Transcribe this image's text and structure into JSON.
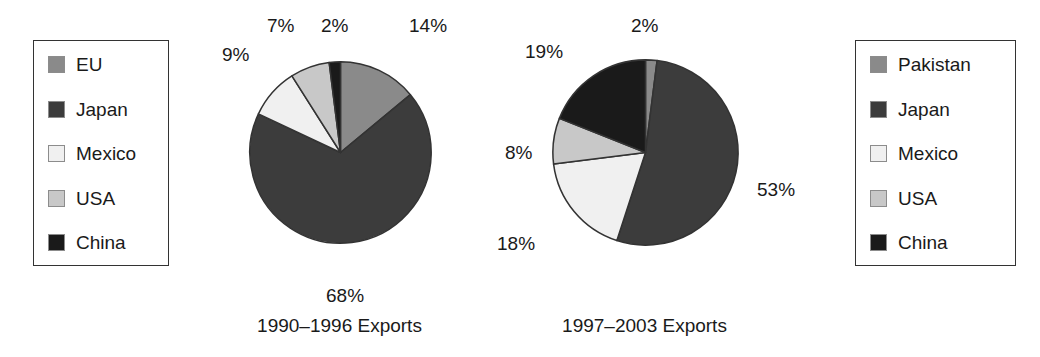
{
  "figure": {
    "background": "#ffffff",
    "width": 1040,
    "height": 357
  },
  "palette": {
    "medium_gray": "#8a8a8a",
    "dark_gray": "#3c3c3c",
    "near_white": "#f0f0f0",
    "light_gray": "#c8c8c8",
    "black": "#1a1a1a",
    "outline": "#333333",
    "swatch_border": "#8c8c8c"
  },
  "legend_left": {
    "items": [
      {
        "label": "EU",
        "color": "#8a8a8a"
      },
      {
        "label": "Japan",
        "color": "#3c3c3c"
      },
      {
        "label": "Mexico",
        "color": "#f0f0f0"
      },
      {
        "label": "USA",
        "color": "#c8c8c8"
      },
      {
        "label": "China",
        "color": "#1a1a1a"
      }
    ]
  },
  "legend_right": {
    "items": [
      {
        "label": "Pakistan",
        "color": "#8a8a8a"
      },
      {
        "label": "Japan",
        "color": "#3c3c3c"
      },
      {
        "label": "Mexico",
        "color": "#f0f0f0"
      },
      {
        "label": "USA",
        "color": "#c8c8c8"
      },
      {
        "label": "China",
        "color": "#1a1a1a"
      }
    ]
  },
  "chart_data": [
    {
      "type": "pie",
      "title": "1990–1996 Exports",
      "caption": "1990–1996 Exports",
      "unit": "percent",
      "start_angle_deg": 0,
      "direction": "clockwise",
      "legend_position": "left",
      "grid": false,
      "labels": [
        "EU",
        "Japan",
        "Mexico",
        "USA",
        "China"
      ],
      "values": [
        14,
        68,
        9,
        7,
        2
      ],
      "slices": [
        {
          "label": "EU",
          "value": 14,
          "value_label": "14%",
          "color": "#8a8a8a"
        },
        {
          "label": "Japan",
          "value": 68,
          "value_label": "68%",
          "color": "#3c3c3c"
        },
        {
          "label": "Mexico",
          "value": 9,
          "value_label": "9%",
          "color": "#f0f0f0"
        },
        {
          "label": "USA",
          "value": 7,
          "value_label": "7%",
          "color": "#c8c8c8"
        },
        {
          "label": "China",
          "value": 2,
          "value_label": "2%",
          "color": "#1a1a1a"
        }
      ],
      "data_labels": [
        "14%",
        "68%",
        "9%",
        "7%",
        "2%"
      ]
    },
    {
      "type": "pie",
      "title": "1997–2003 Exports",
      "caption": "1997–2003 Exports",
      "unit": "percent",
      "start_angle_deg": 0,
      "direction": "clockwise",
      "legend_position": "right",
      "grid": false,
      "labels": [
        "Pakistan",
        "Japan",
        "Mexico",
        "USA",
        "China"
      ],
      "values": [
        2,
        53,
        18,
        8,
        19
      ],
      "slices": [
        {
          "label": "Pakistan",
          "value": 2,
          "value_label": "2%",
          "color": "#8a8a8a"
        },
        {
          "label": "Japan",
          "value": 53,
          "value_label": "53%",
          "color": "#3c3c3c"
        },
        {
          "label": "Mexico",
          "value": 18,
          "value_label": "18%",
          "color": "#f0f0f0"
        },
        {
          "label": "USA",
          "value": 8,
          "value_label": "8%",
          "color": "#c8c8c8"
        },
        {
          "label": "China",
          "value": 19,
          "value_label": "19%",
          "color": "#1a1a1a"
        }
      ],
      "data_labels": [
        "2%",
        "53%",
        "18%",
        "8%",
        "19%"
      ]
    }
  ],
  "pie_left_labels": {
    "eu": "14%",
    "japan": "68%",
    "mexico": "9%",
    "usa": "7%",
    "china": "2%"
  },
  "pie_right_labels": {
    "pakistan": "2%",
    "japan": "53%",
    "mexico": "18%",
    "usa": "8%",
    "china": "19%"
  },
  "captions": {
    "left": "1990–1996 Exports",
    "right": "1997–2003 Exports"
  }
}
